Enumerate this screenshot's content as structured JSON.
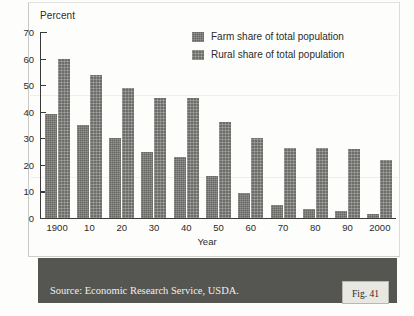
{
  "chart_data": {
    "type": "bar",
    "title": "",
    "xlabel": "Year",
    "ylabel": "Percent",
    "ylim": [
      0,
      70
    ],
    "yticks": [
      0,
      10,
      20,
      30,
      40,
      50,
      60,
      70
    ],
    "grid": false,
    "legend_position": "top-right",
    "categories": [
      "1900",
      "10",
      "20",
      "30",
      "40",
      "50",
      "60",
      "70",
      "80",
      "90",
      "2000"
    ],
    "series": [
      {
        "name": "Farm share of total population",
        "color": "#666663",
        "values": [
          39,
          35,
          30,
          25,
          23,
          16,
          9.5,
          5,
          3.5,
          2.5,
          1.5
        ]
      },
      {
        "name": "Rural share of total population",
        "color": "#6d6d6a",
        "values": [
          60,
          54,
          49,
          45,
          45,
          36,
          30,
          26.5,
          26.5,
          26,
          22
        ]
      }
    ]
  },
  "axes": {
    "y_axis_title": "Percent",
    "x_axis_title": "Year",
    "y_tick_labels": [
      "70",
      "60",
      "50",
      "40",
      "30",
      "20",
      "10",
      "0"
    ],
    "x_tick_labels": [
      "1900",
      "10",
      "20",
      "30",
      "40",
      "50",
      "60",
      "70",
      "80",
      "90",
      "2000"
    ]
  },
  "legend": {
    "items": [
      {
        "label": "Farm share of total population",
        "swatch": "farm"
      },
      {
        "label": "Rural share of total population",
        "swatch": "rural"
      }
    ]
  },
  "footer": {
    "source": "Source: Economic Research Service, USDA.",
    "figure_label": "Fig. 41",
    "band_color": "#555552"
  }
}
